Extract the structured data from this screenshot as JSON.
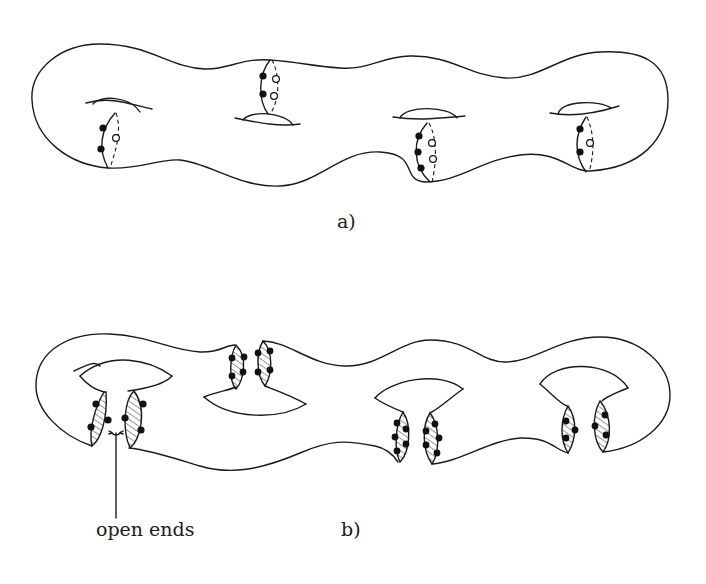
{
  "figure": {
    "panel_a": {
      "label": "a)",
      "description": "closed genus-4 surface with cut circles",
      "handles": 4
    },
    "panel_b": {
      "label": "b)",
      "description": "surface cut open along the circles",
      "annotation": "open ends"
    }
  }
}
